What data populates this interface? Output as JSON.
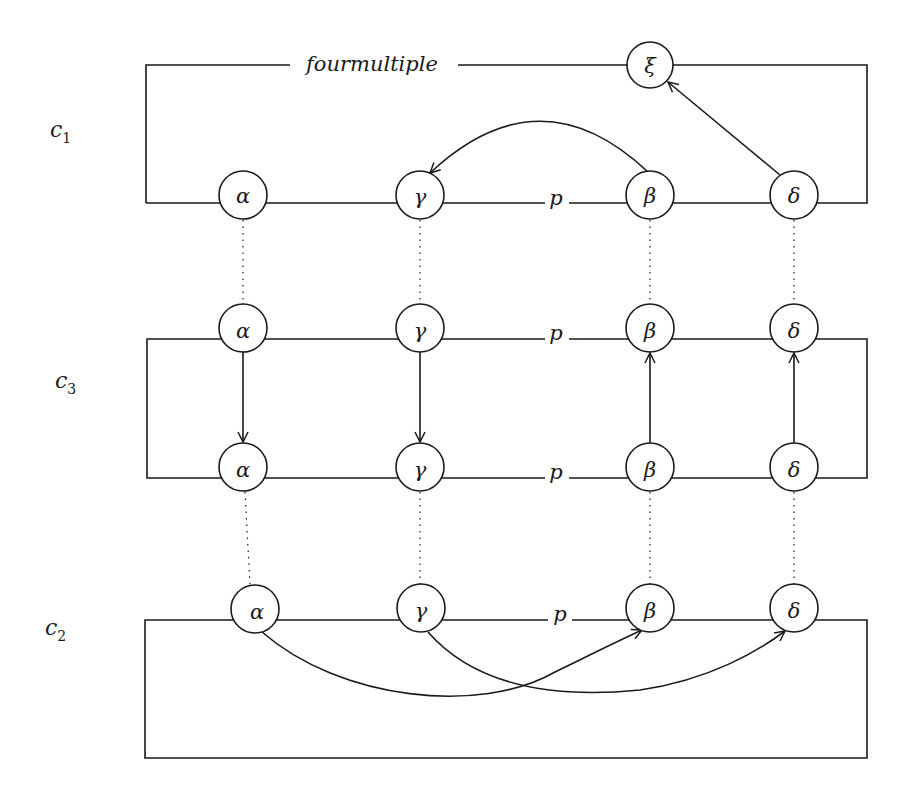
{
  "diagram": {
    "rows": {
      "c1": {
        "label": "c",
        "subscript": "1"
      },
      "c3": {
        "label": "c",
        "subscript": "3"
      },
      "c2": {
        "label": "c",
        "subscript": "2"
      }
    },
    "labels": {
      "top_line": "fourmultiple",
      "p": "p"
    },
    "nodes": {
      "c1": {
        "alpha": "α",
        "gamma": "γ",
        "beta": "β",
        "delta": "δ",
        "xi": "ξ"
      },
      "c3_top": {
        "alpha": "α",
        "gamma": "γ",
        "beta": "β",
        "delta": "δ"
      },
      "c3_bottom": {
        "alpha": "α",
        "gamma": "γ",
        "beta": "β",
        "delta": "δ"
      },
      "c2": {
        "alpha": "α",
        "gamma": "γ",
        "beta": "β",
        "delta": "δ"
      }
    },
    "edges": [
      {
        "from": "c1.beta",
        "to": "c1.gamma",
        "type": "arc"
      },
      {
        "from": "c1.delta",
        "to": "c1.xi",
        "type": "straight"
      },
      {
        "from": "c3_top.alpha",
        "to": "c3_bottom.alpha",
        "type": "straight"
      },
      {
        "from": "c3_top.gamma",
        "to": "c3_bottom.gamma",
        "type": "straight"
      },
      {
        "from": "c3_bottom.beta",
        "to": "c3_top.beta",
        "type": "straight"
      },
      {
        "from": "c3_bottom.delta",
        "to": "c3_top.delta",
        "type": "straight"
      },
      {
        "from": "c2.alpha",
        "to": "c2.beta",
        "type": "curve"
      },
      {
        "from": "c2.gamma",
        "to": "c2.delta",
        "type": "curve"
      }
    ],
    "correspondences": "dotted vertical lines link α, γ, β, δ across c1, c3, c2"
  }
}
